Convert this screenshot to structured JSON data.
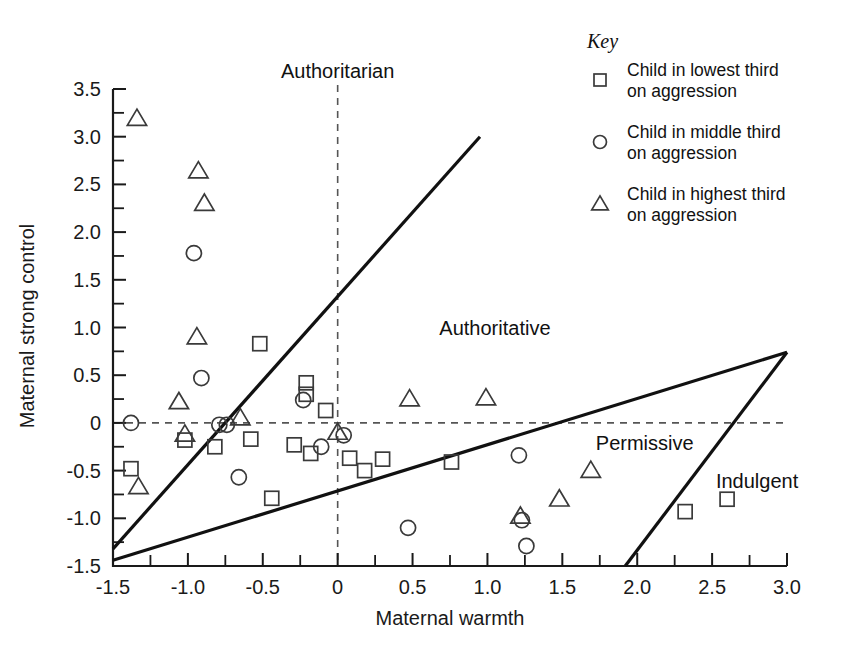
{
  "chart_data": {
    "type": "scatter",
    "title": "",
    "xlabel": "Maternal warmth",
    "ylabel": "Maternal strong control",
    "xlim": [
      -1.5,
      3.0
    ],
    "ylim": [
      -1.5,
      3.5
    ],
    "xticks": [
      "-1.5",
      "-1.0",
      "-0.5",
      "0",
      "0.5",
      "1.0",
      "1.5",
      "2.0",
      "2.5",
      "3.0"
    ],
    "xtick_values": [
      -1.5,
      -1.0,
      -0.5,
      0,
      0.5,
      1.0,
      1.5,
      2.0,
      2.5,
      3.0
    ],
    "yticks": [
      "-1.5",
      "-1.0",
      "-0.5",
      "0",
      "0.5",
      "1.0",
      "1.5",
      "2.0",
      "2.5",
      "3.0",
      "3.5"
    ],
    "ytick_values": [
      -1.5,
      -1.0,
      -0.5,
      0,
      0.5,
      1.0,
      1.5,
      2.0,
      2.5,
      3.0,
      3.5
    ],
    "grid": false,
    "legend_position": "top-right",
    "reference_lines": [
      {
        "name": "vertical-zero",
        "style": "dashed",
        "x": 0
      },
      {
        "name": "horizontal-zero",
        "style": "dashed",
        "y": 0
      }
    ],
    "divider_lines": [
      {
        "name": "authoritarian-authoritative-divider",
        "x1": -1.5,
        "y1": -1.32,
        "x2": 0.95,
        "y2": 3.0
      },
      {
        "name": "authoritative-permissive-divider",
        "x1": -1.5,
        "y1": -1.44,
        "x2": 3.0,
        "y2": 0.74
      },
      {
        "name": "permissive-indulgent-divider",
        "x1": 1.92,
        "y1": -1.5,
        "x2": 3.0,
        "y2": 0.74
      }
    ],
    "region_labels": [
      {
        "name": "authoritarian",
        "text": "Authoritarian",
        "x": 0,
        "y": 3.62
      },
      {
        "name": "authoritative",
        "text": "Authoritative",
        "x": 1.05,
        "y": 0.92
      },
      {
        "name": "permissive",
        "text": "Permissive",
        "x": 2.05,
        "y": -0.28
      },
      {
        "name": "indulgent",
        "text": "Indulgent",
        "x": 2.8,
        "y": -0.68
      }
    ],
    "series": [
      {
        "name": "Child in lowest third on aggression",
        "marker": "square",
        "points": [
          [
            -1.38,
            -0.48
          ],
          [
            -0.52,
            0.83
          ],
          [
            -0.21,
            0.42
          ],
          [
            -0.21,
            0.3
          ],
          [
            -0.08,
            0.13
          ],
          [
            -1.02,
            -0.18
          ],
          [
            -0.82,
            -0.25
          ],
          [
            -0.58,
            -0.17
          ],
          [
            -0.29,
            -0.23
          ],
          [
            -0.18,
            -0.32
          ],
          [
            0.08,
            -0.37
          ],
          [
            0.18,
            -0.5
          ],
          [
            0.3,
            -0.38
          ],
          [
            0.76,
            -0.41
          ],
          [
            -0.44,
            -0.79
          ],
          [
            2.32,
            -0.93
          ],
          [
            2.6,
            -0.8
          ]
        ]
      },
      {
        "name": "Child in middle third on aggression",
        "marker": "circle",
        "points": [
          [
            -0.96,
            1.78
          ],
          [
            -0.91,
            0.47
          ],
          [
            -1.38,
            0.0
          ],
          [
            -0.79,
            -0.02
          ],
          [
            -0.74,
            -0.02
          ],
          [
            -0.23,
            0.24
          ],
          [
            0.04,
            -0.13
          ],
          [
            -0.11,
            -0.25
          ],
          [
            1.21,
            -0.34
          ],
          [
            -0.66,
            -0.57
          ],
          [
            0.47,
            -1.1
          ],
          [
            1.23,
            -1.02
          ],
          [
            1.26,
            -1.29
          ]
        ]
      },
      {
        "name": "Child in highest third on aggression",
        "marker": "triangle",
        "points": [
          [
            -1.34,
            3.19
          ],
          [
            -0.93,
            2.64
          ],
          [
            -0.89,
            2.3
          ],
          [
            -0.94,
            0.9
          ],
          [
            -1.06,
            0.22
          ],
          [
            0.48,
            0.25
          ],
          [
            0.99,
            0.26
          ],
          [
            -0.65,
            0.05
          ],
          [
            -1.02,
            -0.12
          ],
          [
            0.0,
            -0.1
          ],
          [
            -1.33,
            -0.67
          ],
          [
            1.69,
            -0.5
          ],
          [
            1.22,
            -0.98
          ],
          [
            1.48,
            -0.8
          ]
        ]
      }
    ]
  },
  "key": {
    "title": "Key",
    "entries": [
      {
        "marker": "square",
        "line1": "Child in lowest third",
        "line2": "on aggression"
      },
      {
        "marker": "circle",
        "line1": "Child in middle third",
        "line2": "on aggression"
      },
      {
        "marker": "triangle",
        "line1": "Child in highest third",
        "line2": "on aggression"
      }
    ]
  },
  "colors": {
    "axis": "#1a1a1a",
    "marker": "#3a3a3a",
    "dashed": "#555555",
    "divider": "#111111",
    "background": "#ffffff"
  }
}
